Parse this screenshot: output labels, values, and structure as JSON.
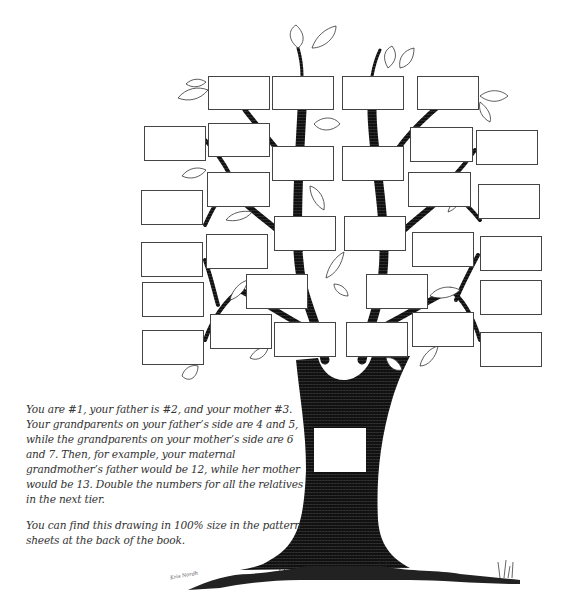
{
  "figure": {
    "boxes": [
      {
        "id": "b1",
        "x": 208,
        "y": 76,
        "w": 62,
        "h": 34
      },
      {
        "id": "b2",
        "x": 272,
        "y": 76,
        "w": 62,
        "h": 34
      },
      {
        "id": "b3",
        "x": 342,
        "y": 76,
        "w": 62,
        "h": 34
      },
      {
        "id": "b4",
        "x": 417,
        "y": 76,
        "w": 62,
        "h": 34
      },
      {
        "id": "b5",
        "x": 144,
        "y": 126,
        "w": 62,
        "h": 35
      },
      {
        "id": "b6",
        "x": 208,
        "y": 123,
        "w": 62,
        "h": 34
      },
      {
        "id": "b7",
        "x": 272,
        "y": 146,
        "w": 62,
        "h": 35
      },
      {
        "id": "b8",
        "x": 342,
        "y": 146,
        "w": 62,
        "h": 35
      },
      {
        "id": "b9",
        "x": 410,
        "y": 127,
        "w": 63,
        "h": 35
      },
      {
        "id": "b10",
        "x": 476,
        "y": 130,
        "w": 62,
        "h": 35
      },
      {
        "id": "b11",
        "x": 207,
        "y": 172,
        "w": 63,
        "h": 35
      },
      {
        "id": "b12",
        "x": 408,
        "y": 172,
        "w": 63,
        "h": 35
      },
      {
        "id": "b13",
        "x": 141,
        "y": 190,
        "w": 62,
        "h": 35
      },
      {
        "id": "b14",
        "x": 478,
        "y": 184,
        "w": 62,
        "h": 35
      },
      {
        "id": "b15",
        "x": 274,
        "y": 216,
        "w": 62,
        "h": 35
      },
      {
        "id": "b16",
        "x": 344,
        "y": 216,
        "w": 62,
        "h": 35
      },
      {
        "id": "b17",
        "x": 206,
        "y": 234,
        "w": 62,
        "h": 35
      },
      {
        "id": "b18",
        "x": 412,
        "y": 232,
        "w": 62,
        "h": 35
      },
      {
        "id": "b19",
        "x": 141,
        "y": 242,
        "w": 62,
        "h": 35
      },
      {
        "id": "b20",
        "x": 480,
        "y": 236,
        "w": 62,
        "h": 35
      },
      {
        "id": "b21",
        "x": 246,
        "y": 274,
        "w": 62,
        "h": 35
      },
      {
        "id": "b22",
        "x": 366,
        "y": 274,
        "w": 62,
        "h": 35
      },
      {
        "id": "b23",
        "x": 142,
        "y": 282,
        "w": 62,
        "h": 35
      },
      {
        "id": "b24",
        "x": 480,
        "y": 280,
        "w": 62,
        "h": 35
      },
      {
        "id": "b25",
        "x": 210,
        "y": 314,
        "w": 62,
        "h": 35
      },
      {
        "id": "b26",
        "x": 412,
        "y": 312,
        "w": 62,
        "h": 35
      },
      {
        "id": "b27",
        "x": 274,
        "y": 322,
        "w": 62,
        "h": 35
      },
      {
        "id": "b28",
        "x": 346,
        "y": 322,
        "w": 62,
        "h": 35
      },
      {
        "id": "b29",
        "x": 142,
        "y": 330,
        "w": 62,
        "h": 35
      },
      {
        "id": "b30",
        "x": 480,
        "y": 332,
        "w": 62,
        "h": 35
      },
      {
        "id": "b31",
        "x": 314,
        "y": 428,
        "w": 52,
        "h": 44
      }
    ]
  },
  "caption": {
    "paragraph1": "You are #1, your father is #2, and your mother #3. Your grandparents on your father’s side are 4 and 5, while the grandparents on your mother’s side are 6 and 7. Then, for example, your maternal grandmother’s father would be 12, while her mother would be 13. Double the numbers for all the relatives in the next tier.",
    "paragraph2": "You can find this drawing in 100% size in the pattern sheets at the back of the book."
  },
  "signature": "Kris Nordh"
}
